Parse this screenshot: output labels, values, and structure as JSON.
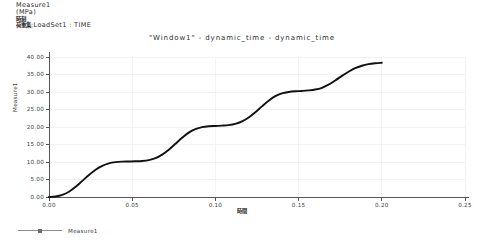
{
  "header": {
    "line1": "Measure1",
    "line2": "(MPa)",
    "line3": "時刻",
    "line4_prefix": "荷重集",
    "line4_rest": ":LoadSet1 :   TIME"
  },
  "legend": {
    "series_label": "Measure1",
    "line_color": "#8c8c8c"
  },
  "chart_data": {
    "type": "line",
    "title": "\"Window1\" - dynamic_time - dynamic_time",
    "xlabel": "時間",
    "ylabel": "Measure1",
    "units": "MPa",
    "grid": true,
    "legend_position": "bottom-left",
    "xlim": [
      0.0,
      0.25
    ],
    "ylim": [
      0.0,
      40.0
    ],
    "xticks": [
      "0.00",
      "0.05",
      "0.10",
      "0.15",
      "0.20",
      "0.25"
    ],
    "xtick_values": [
      0.0,
      0.05,
      0.1,
      0.15,
      0.2,
      0.25
    ],
    "yticks": [
      "0.00",
      "5.00",
      "10.00",
      "15.00",
      "20.00",
      "25.00",
      "30.00",
      "35.00",
      "40.00"
    ],
    "ytick_values": [
      0,
      5,
      10,
      15,
      20,
      25,
      30,
      35,
      40
    ],
    "series": [
      {
        "name": "Measure1",
        "color": "#111111",
        "x": [
          0.0,
          0.004,
          0.008,
          0.012,
          0.016,
          0.02,
          0.024,
          0.028,
          0.032,
          0.036,
          0.04,
          0.044,
          0.048,
          0.052,
          0.056,
          0.06,
          0.064,
          0.068,
          0.072,
          0.076,
          0.08,
          0.084,
          0.088,
          0.092,
          0.096,
          0.1,
          0.104,
          0.108,
          0.112,
          0.116,
          0.12,
          0.124,
          0.128,
          0.132,
          0.136,
          0.14,
          0.144,
          0.148,
          0.152,
          0.156,
          0.16,
          0.164,
          0.168,
          0.172,
          0.176,
          0.18,
          0.184,
          0.188,
          0.192,
          0.196,
          0.2
        ],
        "y": [
          0.0,
          0.15,
          0.6,
          1.5,
          2.9,
          4.6,
          6.3,
          7.8,
          8.9,
          9.6,
          9.95,
          10.1,
          10.15,
          10.2,
          10.3,
          10.55,
          11.1,
          12.1,
          13.5,
          15.2,
          16.9,
          18.4,
          19.4,
          19.95,
          20.2,
          20.3,
          20.4,
          20.55,
          20.9,
          21.6,
          22.7,
          24.2,
          25.9,
          27.5,
          28.8,
          29.6,
          30.0,
          30.2,
          30.3,
          30.45,
          30.7,
          31.2,
          32.1,
          33.3,
          34.6,
          35.8,
          36.8,
          37.5,
          37.95,
          38.2,
          38.35
        ]
      }
    ]
  }
}
